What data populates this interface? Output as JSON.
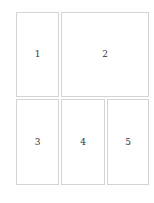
{
  "layout": {
    "panels": [
      {
        "id": "1",
        "label": "1"
      },
      {
        "id": "2",
        "label": "2"
      },
      {
        "id": "3",
        "label": "3"
      },
      {
        "id": "4",
        "label": "4"
      },
      {
        "id": "5",
        "label": "5"
      }
    ]
  },
  "colors": {
    "border": "#d4d4d4",
    "text": "#333333",
    "background": "#ffffff"
  }
}
